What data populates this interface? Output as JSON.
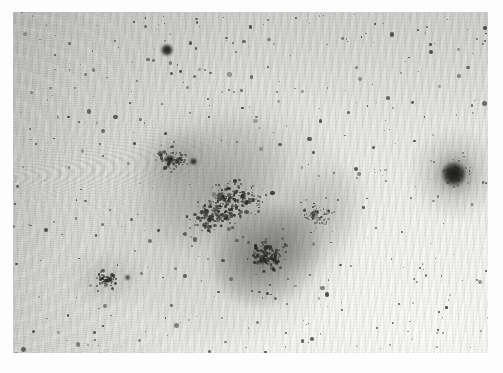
{
  "image": {
    "title": "Astronomical negative plate — resolved irregular dwarf galaxy",
    "alt_text": "Inverted grayscale astronomical photograph showing a resolved irregular dwarf galaxy elongated from upper-left to lower-right, a compact bright globular cluster at right, scattered field stars, and wavy scanner moire artifacts across the background",
    "medium": "photographic plate scan (negative / inverted grayscale)",
    "border_color": "#ffffff",
    "frame": {
      "x": 13,
      "y": 12,
      "width": 475,
      "height": 341
    }
  },
  "palette": {
    "paper_white": "#ffffff",
    "sky_bright": "#fbfbfa",
    "sky_mid": "#e7e7e4",
    "sky_dark": "#d2d2cf",
    "source_dark": "#2a2a28",
    "core_dark": "#262624"
  },
  "chart_data": {
    "type": "scatter",
    "xlabel": "x (pixels)",
    "ylabel": "y (pixels)",
    "xlim": [
      0,
      475
    ],
    "ylim": [
      0,
      341
    ],
    "grid": false,
    "legend": null,
    "note": "Negative image: dark = bright astronomical source. Coordinates are relative to the inner image frame.",
    "background": {
      "description": "Sky background brightness gradient, darkest at left / upper-left edge, brightest toward lower-right corner, overlaid with wavy moire scan interference fringes strongest in the left half.",
      "gradient_from": "#d2d2cf",
      "gradient_to": "#fbfbfa"
    },
    "structures": [
      {
        "name": "irregular-dwarf-galaxy",
        "cx": 212,
        "cy": 196,
        "rx": 126,
        "ry": 120,
        "angle_deg": -34,
        "peak_opacity": 0.2,
        "label": "diffuse halo"
      },
      {
        "name": "galaxy-bar",
        "cx": 200,
        "cy": 171,
        "rx": 82,
        "ry": 59,
        "angle_deg": -32,
        "peak_opacity": 0.27,
        "label": "main body"
      },
      {
        "name": "galaxy-core",
        "cx": 254,
        "cy": 244,
        "rx": 56,
        "ry": 48,
        "angle_deg": -28,
        "peak_opacity": 0.52,
        "label": "dense core clump"
      },
      {
        "name": "galaxy-arm",
        "cx": 305,
        "cy": 203,
        "rx": 59,
        "ry": 43,
        "angle_deg": -46,
        "peak_opacity": 0.24,
        "label": "northeast extension"
      },
      {
        "name": "galaxy-nw-knots",
        "cx": 160,
        "cy": 147,
        "rx": 42,
        "ry": 31,
        "angle_deg": -20,
        "peak_opacity": 0.24,
        "label": "northwest knots"
      },
      {
        "name": "globular-cluster",
        "cx": 442,
        "cy": 162,
        "rx": 50,
        "ry": 48,
        "angle_deg": 0,
        "peak_opacity": 0.62,
        "label": "compact bright cluster"
      },
      {
        "name": "stellar-association",
        "cx": 94,
        "cy": 267,
        "rx": 38,
        "ry": 29,
        "angle_deg": 0,
        "peak_opacity": 0.2,
        "label": "loose stellar association"
      }
    ],
    "bright_sources": [
      {
        "id": "S1",
        "x": 148,
        "y": 32,
        "r": 6.2,
        "label": "bright foreground star"
      },
      {
        "id": "S2",
        "x": 429,
        "y": 150,
        "r": 12.0,
        "label": "globular cluster core"
      },
      {
        "id": "S3",
        "x": 152,
        "y": 143,
        "r": 4.6,
        "label": "galaxy knot A"
      },
      {
        "id": "S4",
        "x": 177,
        "y": 146,
        "r": 3.6,
        "label": "galaxy knot B"
      },
      {
        "id": "S5",
        "x": 206,
        "y": 180,
        "r": 2.4,
        "label": "galaxy knot C"
      },
      {
        "id": "S6",
        "x": 112,
        "y": 263,
        "r": 2.6,
        "label": "association star"
      }
    ],
    "field_stars_count": 430,
    "galaxy_member_stars_count": 340
  }
}
